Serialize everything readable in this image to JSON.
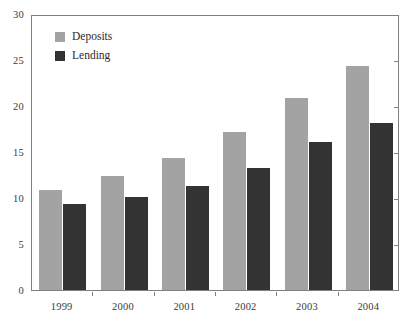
{
  "chart_data": {
    "type": "bar",
    "title": "",
    "subtitle": "",
    "xlabel": "",
    "ylabel": "",
    "categories": [
      "1999",
      "2000",
      "2001",
      "2002",
      "2003",
      "2004"
    ],
    "series": [
      {
        "name": "Deposits",
        "color": "#a3a3a3",
        "values": [
          10.9,
          12.4,
          14.4,
          17.2,
          20.9,
          24.3
        ]
      },
      {
        "name": "Lending",
        "color": "#333333",
        "values": [
          9.4,
          10.1,
          11.3,
          13.3,
          16.1,
          18.1
        ]
      }
    ],
    "ylim": [
      0,
      30
    ],
    "yticks": [
      0,
      5,
      10,
      15,
      20,
      25,
      30
    ],
    "ytick_labels": [
      "0",
      "5",
      "10",
      "15",
      "20",
      "25",
      "30"
    ],
    "grid": false,
    "legend_position": "top-left",
    "frame": "box",
    "annotations": []
  },
  "legend": {
    "entries": [
      {
        "label": "Deposits",
        "swatch": "legend-swatch-deposits"
      },
      {
        "label": "Lending",
        "swatch": "legend-swatch-lending"
      }
    ]
  }
}
